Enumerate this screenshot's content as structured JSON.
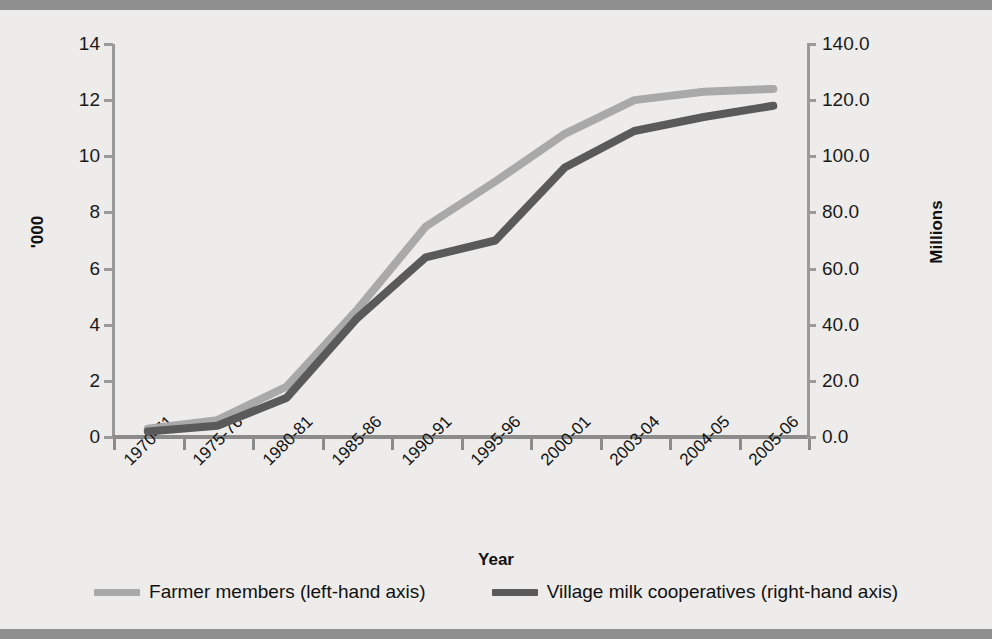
{
  "chart_data": {
    "type": "line",
    "title": "",
    "xlabel": "Year",
    "ylabel": "'000",
    "ylabel_secondary": "Millions",
    "categories": [
      "1970-71",
      "1975-76",
      "1980-81",
      "1985-86",
      "1990-91",
      "1995-96",
      "2000-01",
      "2003-04",
      "2004-05",
      "2005-06"
    ],
    "ylim": [
      0,
      14
    ],
    "ylim_secondary": [
      0.0,
      140.0
    ],
    "yticks": [
      "0",
      "2",
      "4",
      "6",
      "8",
      "10",
      "12",
      "14"
    ],
    "yticks_secondary": [
      "0.0",
      "20.0",
      "40.0",
      "60.0",
      "80.0",
      "100.0",
      "120.0",
      "140.0"
    ],
    "grid": false,
    "legend_position": "bottom",
    "series": [
      {
        "name": "Farmer members (left-hand axis)",
        "axis": "left",
        "color": "#a9a9a9",
        "values": [
          0.3,
          0.6,
          1.8,
          4.5,
          7.5,
          9.1,
          10.8,
          12.0,
          12.3,
          12.4
        ]
      },
      {
        "name": "Village milk cooperatives (right-hand axis)",
        "axis": "right",
        "color": "#5a5a5a",
        "values": [
          2.0,
          4.0,
          14.0,
          42.0,
          64.0,
          70.0,
          96.0,
          109.0,
          114.0,
          118.0
        ]
      }
    ]
  },
  "legend": {
    "items": [
      {
        "label": "Farmer members (left-hand axis)",
        "color": "#a9a9a9"
      },
      {
        "label": "Village milk cooperatives (right-hand axis)",
        "color": "#5a5a5a"
      }
    ]
  },
  "axes": {
    "left_title": "'000",
    "right_title": "Millions",
    "x_title": "Year"
  },
  "colors": {
    "background": "#edecea",
    "rule": "#8f8f8f",
    "axis": "#9a9a9a",
    "series_light": "#a9a9a9",
    "series_dark": "#5a5a5a"
  }
}
